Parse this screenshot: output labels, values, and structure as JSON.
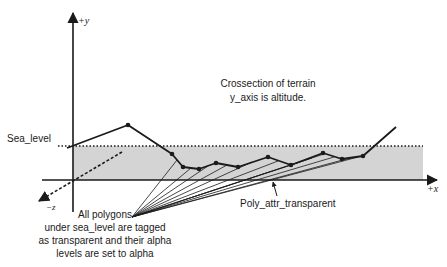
{
  "diagram": {
    "title_line1": "Crossection of terrain",
    "title_line2": "y_axis is altitude.",
    "sea_level_label": "Sea_level",
    "axes": {
      "y_label": "+y",
      "x_label": "+x",
      "z_label": "−z"
    },
    "callout_poly_attr": "Poly_attr_transparent",
    "callout_polygons": [
      "All polygons",
      "under sea_level are tagged",
      "as transparent and their alpha",
      "levels are set to alpha"
    ],
    "colors": {
      "ink": "#1a1a1a",
      "water_fill": "#d4d4d4"
    }
  },
  "geometry": {
    "origin": [
      73,
      180
    ],
    "y_axis": {
      "top": 12,
      "bottom": 212
    },
    "x_axis": {
      "left": 42,
      "right": 437
    },
    "sea_level_y": 146,
    "water_rect": {
      "x": 73,
      "y": 146,
      "w": 350,
      "h": 34
    },
    "terrain_points": [
      [
        67,
        148
      ],
      [
        128,
        125
      ],
      [
        172,
        154
      ],
      [
        183,
        167
      ],
      [
        199,
        169
      ],
      [
        216,
        163
      ],
      [
        238,
        167
      ],
      [
        268,
        157
      ],
      [
        291,
        165
      ],
      [
        323,
        153
      ],
      [
        342,
        159
      ],
      [
        363,
        156
      ],
      [
        396,
        127
      ]
    ],
    "fan_origin": [
      132,
      217
    ],
    "fan_targets": [
      [
        177,
        160
      ],
      [
        191,
        168
      ],
      [
        208,
        166
      ],
      [
        227,
        165
      ],
      [
        252,
        162
      ],
      [
        278,
        161
      ],
      [
        300,
        162
      ],
      [
        312,
        158
      ],
      [
        324,
        154
      ],
      [
        334,
        157
      ],
      [
        350,
        158
      ],
      [
        358,
        157
      ]
    ]
  }
}
